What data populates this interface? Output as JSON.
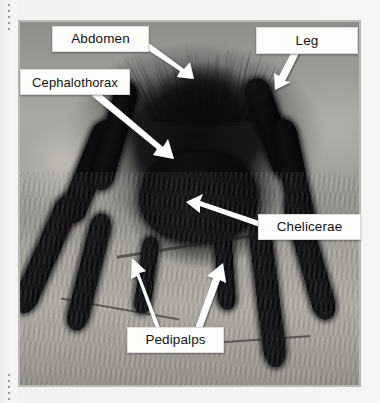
{
  "figure": {
    "kind": "labeled-photograph",
    "frame_border_color": "#b9b9b5",
    "label_background_color": "#fdfdfc",
    "label_text_color": "#131313",
    "arrow_color": "#ffffff"
  },
  "labels": [
    {
      "id": "abdomen",
      "text": "Abdomen",
      "box": {
        "x": 52,
        "y": 26,
        "w": 95,
        "h": 24
      },
      "arrow": {
        "from_x": 147,
        "from_y": 42,
        "to_x": 190,
        "to_y": 73
      }
    },
    {
      "id": "leg",
      "text": "Leg",
      "box": {
        "x": 256,
        "y": 27,
        "w": 100,
        "h": 25
      },
      "arrow": {
        "from_x": 296,
        "from_y": 52,
        "to_x": 277,
        "to_y": 84
      }
    },
    {
      "id": "cephalothorax",
      "text": "Cephalothorax",
      "box": {
        "x": 20,
        "y": 69,
        "w": 108,
        "h": 24
      },
      "arrow": {
        "from_x": 98,
        "from_y": 93,
        "to_x": 167,
        "to_y": 152
      }
    },
    {
      "id": "chelicerae",
      "text": "Chelicerae",
      "box": {
        "x": 258,
        "y": 214,
        "w": 101,
        "h": 24
      },
      "arrow": {
        "from_x": 258,
        "from_y": 221,
        "to_x": 189,
        "to_y": 201
      }
    },
    {
      "id": "pedipalps",
      "text": "Pedipalps",
      "box": {
        "x": 127,
        "y": 327,
        "w": 95,
        "h": 24
      },
      "arrows": [
        {
          "from_x": 152,
          "from_y": 327,
          "to_x": 134,
          "to_y": 271
        },
        {
          "from_x": 196,
          "from_y": 327,
          "to_x": 213,
          "to_y": 275
        }
      ]
    }
  ]
}
